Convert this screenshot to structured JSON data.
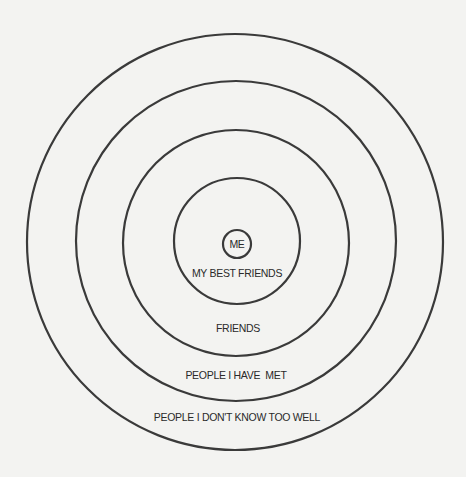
{
  "diagram": {
    "type": "concentric-circles",
    "colors": {
      "background": "#f3f3f1",
      "stroke": "#3a3a3a",
      "text": "#2a2a2a"
    },
    "rings": [
      {
        "id": "me",
        "label": "ME",
        "cx": 237,
        "cy": 244,
        "r": 14,
        "label_x": 237,
        "label_y": 244
      },
      {
        "id": "best-friends",
        "label": "MY BEST FRIENDS",
        "cx": 237,
        "cy": 241,
        "r": 63,
        "label_x": 237,
        "label_y": 273
      },
      {
        "id": "friends",
        "label": "FRIENDS",
        "cx": 236,
        "cy": 243,
        "r": 113,
        "label_x": 238,
        "label_y": 328
      },
      {
        "id": "people-met",
        "label": "PEOPLE I HAVE  MET",
        "cx": 236,
        "cy": 241,
        "r": 160,
        "label_x": 236,
        "label_y": 375
      },
      {
        "id": "people-unknown",
        "label": "PEOPLE I DON'T KNOW TOO WELL",
        "cx": 235,
        "cy": 242,
        "r": 208,
        "label_x": 237,
        "label_y": 417
      }
    ]
  }
}
